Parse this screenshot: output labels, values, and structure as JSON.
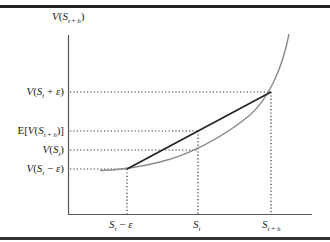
{
  "diagram": {
    "y_axis_label": "V(S_{t+h})",
    "y_labels": [
      {
        "text": "V(S_t + ε)",
        "y": 92
      },
      {
        "text": "E[V(S_{t+h})]",
        "y": 131
      },
      {
        "text": "V(S_t)",
        "y": 150
      },
      {
        "text": "V(S_t − ε)",
        "y": 169
      }
    ],
    "x_labels": [
      {
        "text": "S_t − ε",
        "x": 127
      },
      {
        "text": "S_t",
        "x": 198
      },
      {
        "text": "S_{t+h}",
        "x": 271
      }
    ],
    "curve": "convex value function",
    "chord": "line from V(S_t − ε) to V(S_t + ε)",
    "colors": {
      "curve": "#8a8a8a",
      "chord": "#222222",
      "axes": "#555555",
      "frame": "#222222"
    }
  }
}
